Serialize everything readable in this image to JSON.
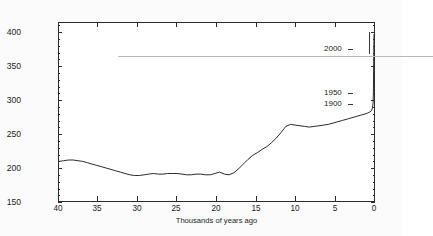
{
  "chart_data": {
    "type": "line",
    "title": "",
    "xlabel": "Thousands of years ago",
    "ylabel": "CO2 Concentration (ppm)",
    "ylabel_rich": "CO₂ Concentration (ppm)",
    "xlim": [
      40,
      0
    ],
    "ylim": [
      150,
      415
    ],
    "xticks": [
      40,
      35,
      30,
      25,
      20,
      15,
      10,
      5,
      0
    ],
    "yticks": [
      150,
      200,
      250,
      300,
      350,
      400
    ],
    "xtick_labels": [
      "40",
      "35",
      "30",
      "25",
      "20",
      "15",
      "10",
      "5",
      "0"
    ],
    "ytick_labels": [
      "150",
      "200",
      "250",
      "300",
      "350",
      "400"
    ],
    "grid": false,
    "legend": null,
    "x_axis_inverted": true,
    "reference_lines": [
      {
        "name": "400-ppm-line",
        "y": 400,
        "color": "#b9b9b9",
        "label": ""
      }
    ],
    "annotations": [
      {
        "label": "2000",
        "x": 0,
        "y": 370
      },
      {
        "label": "1950",
        "x": 0,
        "y": 312
      },
      {
        "label": "1900",
        "x": 0,
        "y": 296
      }
    ],
    "series": [
      {
        "name": "CO2 concentration",
        "color": "#2b2b2b",
        "x": [
          40.0,
          39.4,
          38.8,
          38.2,
          37.6,
          37.0,
          36.4,
          35.8,
          35.2,
          34.6,
          34.0,
          33.4,
          32.8,
          32.2,
          31.6,
          31.0,
          30.4,
          29.8,
          29.2,
          28.6,
          28.0,
          27.4,
          26.8,
          26.2,
          25.6,
          25.0,
          24.4,
          23.8,
          23.2,
          22.6,
          22.0,
          21.4,
          20.8,
          20.2,
          19.6,
          19.0,
          18.4,
          17.8,
          17.2,
          16.6,
          16.0,
          15.4,
          14.8,
          14.2,
          13.6,
          13.0,
          12.4,
          11.8,
          11.2,
          10.6,
          10.0,
          9.4,
          8.8,
          8.2,
          7.6,
          7.0,
          6.4,
          5.8,
          5.2,
          4.6,
          4.0,
          3.4,
          2.8,
          2.2,
          1.6,
          1.0,
          0.6,
          0.35,
          0.2,
          0.12,
          0.07,
          0.05,
          0.02,
          0.0
        ],
        "y": [
          209,
          210,
          211,
          211,
          210,
          209,
          207,
          205,
          203,
          201,
          199,
          197,
          195,
          193,
          191,
          189,
          188,
          188,
          189,
          190,
          191,
          190,
          190,
          191,
          191,
          191,
          190,
          189,
          189,
          190,
          190,
          189,
          189,
          191,
          193,
          190,
          189,
          192,
          198,
          205,
          212,
          218,
          222,
          227,
          231,
          237,
          244,
          252,
          261,
          264,
          263,
          262,
          261,
          260,
          261,
          262,
          263,
          264,
          266,
          268,
          270,
          272,
          274,
          276,
          278,
          280,
          282,
          284,
          288,
          296,
          312,
          340,
          372,
          398
        ],
        "ylabels": []
      }
    ]
  },
  "axis": {
    "y_title_prefix": "CO",
    "y_title_sub": "2",
    "y_title_suffix": " Concentration (ppm)"
  }
}
